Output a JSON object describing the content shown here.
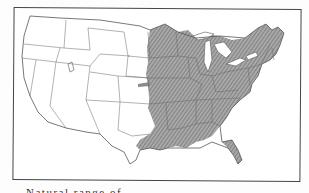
{
  "figure": {
    "type": "range map",
    "region": "Contiguous United States",
    "legend": {
      "shaded_area": "Natural range (hatched)",
      "unshaded_area": "Outside range"
    },
    "colors": {
      "range_fill": "#9a9a9a",
      "hatch": "#666666",
      "state_lines": "#555555",
      "frame": "#444444",
      "background": "#ffffff"
    },
    "caption": "Natural range of"
  }
}
